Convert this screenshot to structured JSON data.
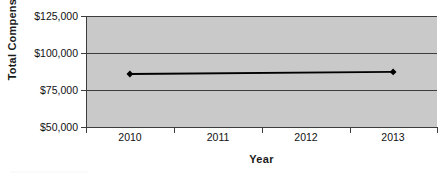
{
  "chart_data": {
    "type": "line",
    "title": "",
    "xlabel": "Year",
    "ylabel": "Total Compensation",
    "categories": [
      "2010",
      "2011",
      "2012",
      "2013"
    ],
    "series": [
      {
        "name": "Total Compensation",
        "points": [
          {
            "x": "2010",
            "y": 85800
          },
          {
            "x": "2013",
            "y": 87200
          }
        ],
        "values": [
          85800,
          null,
          null,
          87200
        ],
        "marker": "diamond",
        "color": "#000000"
      }
    ],
    "ylim": [
      50000,
      125000
    ],
    "ytick_values": [
      50000,
      75000,
      100000,
      125000
    ],
    "ytick_labels": [
      "$50,000",
      "$75,000",
      "$100,000",
      "$125,000"
    ],
    "xtick_labels": [
      "2010",
      "2011",
      "2012",
      "2013"
    ],
    "grid": true,
    "grid_axis": "y",
    "legend": false,
    "plot_background": "#c9c9c9",
    "page_background": "#ffffff",
    "axis_color": "#3d3d3d"
  },
  "axes": {
    "y_title": "Total Compensation",
    "x_title": "Year"
  }
}
